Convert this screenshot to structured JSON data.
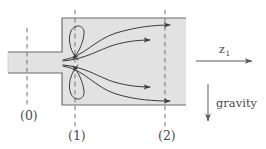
{
  "figure": {
    "colors": {
      "duct_fill": "#e2e2e2",
      "duct_stroke": "#6b6b6b",
      "streamline": "#3a3a3a",
      "dashed_line": "#7a7a7a",
      "label_text": "#4a4a4a",
      "background": "#ffffff"
    },
    "geometry": {
      "inlet_pipe": {
        "x": 8,
        "y": 52,
        "width": 56,
        "height": 21
      },
      "chamber": {
        "x": 62,
        "y": 18,
        "width": 124,
        "height": 87
      }
    },
    "station_labels": [
      {
        "name": "station-0",
        "text": "(0)",
        "x": 20,
        "y": 120,
        "dash_x": 27,
        "dash_y1": 28,
        "dash_y2": 108
      },
      {
        "name": "station-1",
        "text": "(1)",
        "x": 68,
        "y": 140,
        "dash_x": 75,
        "dash_y1": 10,
        "dash_y2": 128
      },
      {
        "name": "station-2",
        "text": "(2)",
        "x": 158,
        "y": 140,
        "dash_x": 165,
        "dash_y1": 10,
        "dash_y2": 128
      }
    ],
    "axis_arrow": {
      "label": "z",
      "subscript": "1",
      "x1": 196,
      "x2": 255,
      "y": 61,
      "label_x": 222,
      "label_y": 52
    },
    "gravity_arrow": {
      "label": "gravity",
      "x": 208,
      "y1": 84,
      "y2": 124,
      "label_x": 216,
      "label_y": 103
    },
    "streamlines": [
      {
        "name": "streamline-upper-outer",
        "path": "M 64,60 C 86,58 96,40 120,33 C 140,27 156,26 172,25"
      },
      {
        "name": "streamline-upper-inner",
        "path": "M 64,61 C 88,60 100,50 118,45 C 132,41 142,40 152,40"
      },
      {
        "name": "streamline-lower-inner",
        "path": "M 64,65 C 88,67 100,77 118,82 C 132,86 142,87 152,87"
      },
      {
        "name": "streamline-lower-outer",
        "path": "M 64,66 C 86,69 96,87 120,94 C 140,100 156,101 172,101"
      }
    ],
    "vortices": [
      {
        "name": "vortex-upper",
        "path": "M 76,60 C 70,52 68,38 72,30 C 76,23 84,24 84,32 C 84,42 78,52 74,58"
      },
      {
        "name": "vortex-lower",
        "path": "M 76,66 C 70,74 68,88 72,96 C 76,103 84,102 84,94 C 84,84 78,74 74,68"
      }
    ]
  }
}
